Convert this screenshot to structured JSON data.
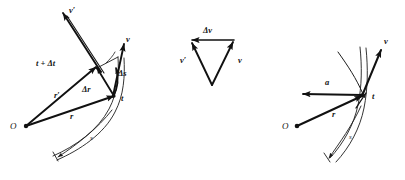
{
  "figure": {
    "type": "physics-kinematics-diagram",
    "background_color": "#ffffff",
    "ink_color": "#111111",
    "panels": [
      {
        "id": "left-panel",
        "name": "position-displacement-panel",
        "description": "Position vectors at times t and t+dt with displacement and path length",
        "origin_label": "O",
        "labels": [
          {
            "key": "v_prime",
            "text": "v′"
          },
          {
            "key": "v",
            "text": "v"
          },
          {
            "key": "t_plus_dt",
            "text": "t + Δt"
          },
          {
            "key": "delta_s",
            "text": "Δs"
          },
          {
            "key": "delta_r",
            "text": "Δr"
          },
          {
            "key": "r_prime",
            "text": "r′"
          },
          {
            "key": "r",
            "text": "r"
          },
          {
            "key": "t",
            "text": "t"
          },
          {
            "key": "s",
            "text": "s"
          },
          {
            "key": "origin",
            "text": "O"
          }
        ]
      },
      {
        "id": "middle-panel",
        "name": "velocity-triangle-panel",
        "description": "Vector triangle showing v prime plus delta v equals v",
        "labels": [
          {
            "key": "delta_v",
            "text": "Δv"
          },
          {
            "key": "v_prime",
            "text": "v′"
          },
          {
            "key": "v",
            "text": "v"
          }
        ]
      },
      {
        "id": "right-panel",
        "name": "acceleration-panel",
        "description": "Position vector, tangential velocity and acceleration at instant t",
        "origin_label": "O",
        "labels": [
          {
            "key": "v",
            "text": "v"
          },
          {
            "key": "a",
            "text": "a"
          },
          {
            "key": "t",
            "text": "t"
          },
          {
            "key": "r",
            "text": "r"
          },
          {
            "key": "s",
            "text": "s"
          },
          {
            "key": "origin",
            "text": "O"
          }
        ]
      }
    ]
  },
  "left": {
    "origin": "O",
    "v_prime": "v′",
    "v": "v",
    "t_plus_delta_t": "t + Δt",
    "delta_s": "Δs",
    "delta_r": "Δr",
    "r_prime": "r′",
    "r": "r",
    "t": "t",
    "s": "s"
  },
  "middle": {
    "delta_v": "Δv",
    "v_prime": "v′",
    "v": "v"
  },
  "right": {
    "origin": "O",
    "v": "v",
    "a": "a",
    "t": "t",
    "r": "r",
    "s": "s"
  },
  "watermark": {
    "text": ""
  }
}
